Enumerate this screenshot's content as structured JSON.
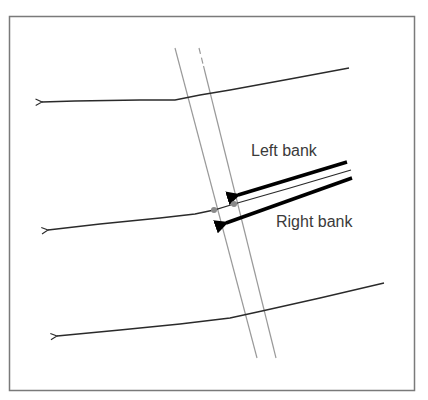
{
  "diagram": {
    "title": "",
    "labels": {
      "left_bank": "Left bank",
      "right_bank": "Right bank"
    },
    "colors": {
      "frame": "#7a7a7a",
      "flow_line": "#2a2a2a",
      "channel_line": "#9a9a9a",
      "bank_arrow": "#000000",
      "intersection_dot": "#8a8a8a",
      "label_text": "#3a3a3a"
    },
    "elements": {
      "frame": {
        "x": 9,
        "y": 16,
        "width": 406,
        "height": 375
      },
      "channel": {
        "left_edge": {
          "from": [
            175,
            48
          ],
          "to": [
            257,
            358
          ]
        },
        "right_edge": {
          "from": [
            199,
            48
          ],
          "to": [
            276,
            358
          ],
          "dashed_top": true
        }
      },
      "flow_lines": [
        {
          "name": "top",
          "points": [
            [
              349,
              68
            ],
            [
              200,
              95
            ],
            [
              175,
              100
            ],
            [
              40,
              102
            ]
          ]
        },
        {
          "name": "middle",
          "points": [
            [
              351,
              170
            ],
            [
              234,
              204
            ],
            [
              214,
              210
            ],
            [
              190,
              216
            ],
            [
              46,
              230
            ]
          ]
        },
        {
          "name": "bottom",
          "points": [
            [
              384,
              283
            ],
            [
              262,
              311
            ],
            [
              230,
              318
            ],
            [
              55,
              336
            ]
          ]
        }
      ],
      "bank_arrows": [
        {
          "name": "left-bank-arrow",
          "from": [
            347,
            162
          ],
          "to": [
            232,
            197
          ]
        },
        {
          "name": "right-bank-arrow",
          "from": [
            352,
            178
          ],
          "to": [
            220,
            226
          ]
        }
      ],
      "intersection_points": [
        [
          214,
          210
        ],
        [
          234,
          204
        ]
      ]
    }
  }
}
